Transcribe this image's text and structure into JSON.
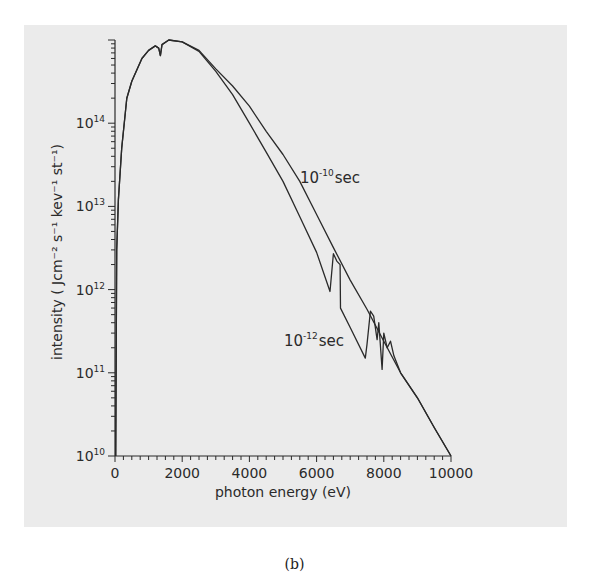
{
  "chart_data": {
    "type": "line",
    "title": "",
    "xlabel": "photon energy (eV)",
    "ylabel": "intensity ( Jcm⁻² s⁻¹ kev⁻¹ st⁻¹)",
    "xlim": [
      0,
      10000
    ],
    "ylim": [
      10000000000.0,
      1000000000000000.0
    ],
    "yscale": "log",
    "grid": false,
    "x_ticks": [
      "0",
      "2000",
      "4000",
      "6000",
      "8000",
      "10000"
    ],
    "y_ticks": [
      {
        "base": "10",
        "exp": "10"
      },
      {
        "base": "10",
        "exp": "11"
      },
      {
        "base": "10",
        "exp": "12"
      },
      {
        "base": "10",
        "exp": "13"
      },
      {
        "base": "10",
        "exp": "14"
      }
    ],
    "series": [
      {
        "name": "10^-10 sec",
        "label_base": "10",
        "label_exp": "-10",
        "label_unit": "sec",
        "points": [
          [
            20,
            10000000000.0
          ],
          [
            50,
            3000000000000.0
          ],
          [
            100,
            12000000000000.0
          ],
          [
            200,
            50000000000000.0
          ],
          [
            350,
            200000000000000.0
          ],
          [
            500,
            320000000000000.0
          ],
          [
            800,
            600000000000000.0
          ],
          [
            1000,
            750000000000000.0
          ],
          [
            1200,
            850000000000000.0
          ],
          [
            1300,
            800000000000000.0
          ],
          [
            1350,
            650000000000000.0
          ],
          [
            1400,
            880000000000000.0
          ],
          [
            1600,
            1000000000000000.0
          ],
          [
            2000,
            950000000000000.0
          ],
          [
            2500,
            750000000000000.0
          ],
          [
            3000,
            450000000000000.0
          ],
          [
            3500,
            280000000000000.0
          ],
          [
            4000,
            160000000000000.0
          ],
          [
            4500,
            80000000000000.0
          ],
          [
            5000,
            42000000000000.0
          ],
          [
            5500,
            20000000000000.0
          ],
          [
            6000,
            8000000000000.0
          ],
          [
            6500,
            3200000000000.0
          ],
          [
            7000,
            1300000000000.0
          ],
          [
            7500,
            580000000000.0
          ],
          [
            8000,
            240000000000.0
          ],
          [
            8500,
            100000000000.0
          ],
          [
            9000,
            50000000000.0
          ],
          [
            9500,
            22000000000.0
          ],
          [
            10000,
            10000000000.0
          ]
        ]
      },
      {
        "name": "10^-12 sec",
        "label_base": "10",
        "label_exp": "-12",
        "label_unit": "sec",
        "points": [
          [
            20,
            10000000000.0
          ],
          [
            50,
            3000000000000.0
          ],
          [
            100,
            12000000000000.0
          ],
          [
            200,
            50000000000000.0
          ],
          [
            350,
            200000000000000.0
          ],
          [
            500,
            320000000000000.0
          ],
          [
            800,
            600000000000000.0
          ],
          [
            1000,
            750000000000000.0
          ],
          [
            1200,
            850000000000000.0
          ],
          [
            1300,
            800000000000000.0
          ],
          [
            1350,
            650000000000000.0
          ],
          [
            1400,
            880000000000000.0
          ],
          [
            1600,
            1000000000000000.0
          ],
          [
            2000,
            950000000000000.0
          ],
          [
            2500,
            730000000000000.0
          ],
          [
            3000,
            420000000000000.0
          ],
          [
            3500,
            220000000000000.0
          ],
          [
            4000,
            100000000000000.0
          ],
          [
            4500,
            45000000000000.0
          ],
          [
            5000,
            20000000000000.0
          ],
          [
            5500,
            7500000000000.0
          ],
          [
            6000,
            2800000000000.0
          ],
          [
            6400,
            950000000000.0
          ],
          [
            6500,
            2700000000000.0
          ],
          [
            6600,
            2200000000000.0
          ],
          [
            6700,
            2000000000000.0
          ],
          [
            6710,
            600000000000.0
          ],
          [
            7000,
            350000000000.0
          ],
          [
            7450,
            150000000000.0
          ],
          [
            7500,
            220000000000.0
          ],
          [
            7600,
            550000000000.0
          ],
          [
            7700,
            480000000000.0
          ],
          [
            7800,
            250000000000.0
          ],
          [
            7850,
            400000000000.0
          ],
          [
            7950,
            110000000000.0
          ],
          [
            8000,
            300000000000.0
          ],
          [
            8100,
            200000000000.0
          ],
          [
            8200,
            240000000000.0
          ],
          [
            8300,
            160000000000.0
          ],
          [
            8500,
            100000000000.0
          ],
          [
            9000,
            50000000000.0
          ],
          [
            9500,
            22000000000.0
          ],
          [
            10000,
            10000000000.0
          ]
        ]
      }
    ]
  },
  "caption": "(b)"
}
